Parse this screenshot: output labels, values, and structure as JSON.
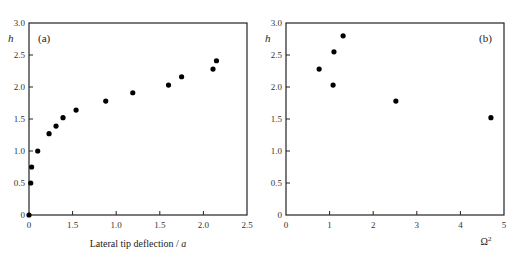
{
  "chart_data": [
    {
      "type": "scatter",
      "panel_label": "(a)",
      "title": "",
      "xlabel": "Lateral tip deflection / a",
      "xlabel_main": "Lateral tip deflection / ",
      "xlabel_var": "a",
      "ylabel": "h",
      "xlim": [
        0,
        2.5
      ],
      "ylim": [
        0,
        3.0
      ],
      "x_ticks": [
        0,
        0.5,
        1.0,
        1.5,
        2.0,
        2.5
      ],
      "x_tick_labels": [
        "0",
        "1.5",
        "1.0",
        "1.5",
        "2.0",
        "2.5"
      ],
      "y_ticks": [
        0,
        0.5,
        1.0,
        1.5,
        2.0,
        2.5,
        3.0
      ],
      "y_tick_labels": [
        "0",
        "0.5",
        "1.0",
        "1.5",
        "2.0",
        "2.5",
        "3.0"
      ],
      "grid": false,
      "legend": null,
      "series": [
        {
          "name": "h vs lateral tip deflection",
          "marker": "filled-circle",
          "color": "#000000",
          "x": [
            0.0,
            0.02,
            0.03,
            0.1,
            0.23,
            0.31,
            0.39,
            0.54,
            0.88,
            1.19,
            1.6,
            1.75,
            2.11,
            2.15
          ],
          "y": [
            0.0,
            0.5,
            0.75,
            1.0,
            1.27,
            1.39,
            1.52,
            1.64,
            1.78,
            1.91,
            2.03,
            2.16,
            2.28,
            2.41
          ]
        }
      ]
    },
    {
      "type": "scatter",
      "panel_label": "(b)",
      "title": "",
      "xlabel": "Ω²",
      "xlabel_main": "Ω",
      "xlabel_sup": "2",
      "ylabel": "h",
      "xlim": [
        0,
        5
      ],
      "ylim": [
        0,
        3.0
      ],
      "x_ticks": [
        0,
        1,
        2,
        3,
        4,
        5
      ],
      "x_tick_labels": [
        "0",
        "1",
        "2",
        "3",
        "4",
        "5"
      ],
      "y_ticks": [
        0,
        0.5,
        1.0,
        1.5,
        2.0,
        2.5,
        3.0
      ],
      "y_tick_labels": [
        "0",
        "0.5",
        "1.0",
        "1.5",
        "2.0",
        "2.5",
        "3.0"
      ],
      "grid": false,
      "legend": null,
      "series": [
        {
          "name": "h vs Omega squared",
          "marker": "filled-circle",
          "color": "#000000",
          "x": [
            0.76,
            1.08,
            1.1,
            1.31,
            2.52,
            4.7
          ],
          "y": [
            2.28,
            2.03,
            2.55,
            2.8,
            1.78,
            1.52
          ]
        }
      ]
    }
  ]
}
